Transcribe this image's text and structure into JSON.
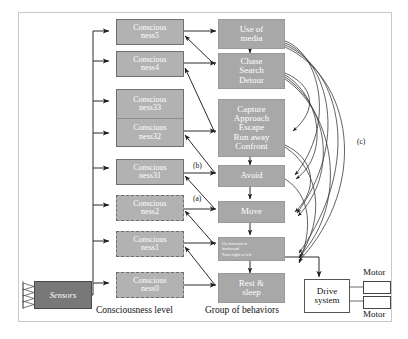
{
  "diagram": {
    "column_labels": {
      "consciousness": "Consciousness level",
      "behaviors": "Group of behaviors"
    },
    "annotations": {
      "a": "(a)",
      "b": "(b)",
      "c": "(c)"
    },
    "sensors": {
      "label": "Sensors"
    },
    "drive": {
      "label_line1": "Drive",
      "label_line2": "system"
    },
    "motors": {
      "top": "Motor",
      "bottom": "Motor"
    },
    "consciousness_levels": [
      {
        "id": "c5",
        "line1": "Conscious",
        "line2": "ness5",
        "style": "solid"
      },
      {
        "id": "c4",
        "line1": "Conscious",
        "line2": "ness4",
        "style": "solid"
      },
      {
        "id": "c33",
        "line1": "Conscious",
        "line2": "ness33",
        "style": "solid"
      },
      {
        "id": "c32",
        "line1": "Conscious",
        "line2": "ness32",
        "style": "solid"
      },
      {
        "id": "c31",
        "line1": "Conscious",
        "line2": "ness31",
        "style": "solid"
      },
      {
        "id": "c2",
        "line1": "Conscious",
        "line2": "ness2",
        "style": "dashed"
      },
      {
        "id": "c1",
        "line1": "Conscious",
        "line2": "ness1",
        "style": "dashed"
      },
      {
        "id": "c0",
        "line1": "Conscious",
        "line2": "ness0",
        "style": "dashed"
      }
    ],
    "behaviors": [
      {
        "id": "b-media",
        "lines": [
          "Use of",
          "media"
        ]
      },
      {
        "id": "b-chase",
        "lines": [
          "Chase",
          "Search",
          "Detour"
        ]
      },
      {
        "id": "b-capture",
        "lines": [
          "Capture",
          "Approach",
          "Escape",
          "Run away",
          "Confront"
        ]
      },
      {
        "id": "b-avoid",
        "lines": [
          "Avoid"
        ]
      },
      {
        "id": "b-move",
        "lines": [
          "Move"
        ]
      },
      {
        "id": "b-locomo",
        "lines": [
          "Go forward or",
          "backward",
          "Turn right or left"
        ]
      },
      {
        "id": "b-rest",
        "lines": [
          "Rest &",
          "sleep"
        ]
      }
    ],
    "colors": {
      "consciousness_fill": "#b2b2b2",
      "behavior_fill": "#a8a8a8",
      "sensors_fill": "#787878",
      "frame_border": "#c8c8c8",
      "line": "#2a2a2a"
    }
  }
}
